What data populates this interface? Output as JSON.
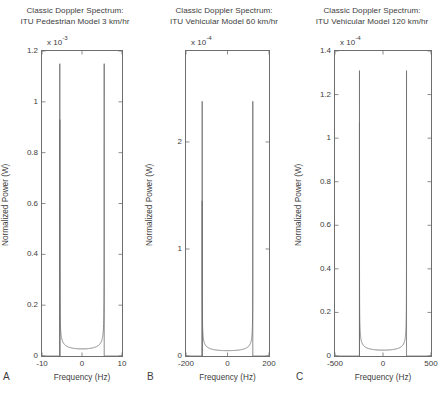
{
  "figure": {
    "background": "#ffffff",
    "line_color": "#6e6e6e",
    "text_color": "#3d3d3d",
    "width": 446,
    "height": 394
  },
  "panels": [
    {
      "letter": "A",
      "title_line1": "Classic Doppler Spectrum:",
      "title_line2": "ITU Pedestrian Model 3 km/hr",
      "exponent_mantissa": "x 10",
      "exponent_power": "-3",
      "ylabel": "Normalized Power (W)",
      "xlabel": "Frequency (Hz)",
      "xticks": [
        -10,
        0,
        10
      ],
      "xtick_labels": [
        "-10",
        "0",
        "10"
      ],
      "yticks": [
        0,
        0.2,
        0.4,
        0.6,
        0.8,
        1,
        1.2
      ],
      "ytick_labels": [
        "0",
        "0.2",
        "0.4",
        "0.6",
        "0.8",
        "1",
        "1.2"
      ],
      "xlim": [
        -10,
        10
      ],
      "ylim": [
        0,
        1.2
      ],
      "chart_data": {
        "type": "line",
        "title": "Classic Doppler Spectrum: ITU Pedestrian Model 3 km/hr",
        "xlabel": "Frequency (Hz)",
        "ylabel": "Normalized Power (W)",
        "xlim": [
          -10,
          10
        ],
        "ylim": [
          0,
          1.2
        ],
        "y_scale_exponent": -3,
        "grid": false,
        "legend": null,
        "doppler_max_hz": 5.55,
        "floor_value": 0.028,
        "left_peak_value": 0.93,
        "right_peak_value": 1.15,
        "description": "U-shaped Jakes classic Doppler spectrum; flat low floor between roughly -4 and +4 Hz rising to sharp spikes at the maximum Doppler frequency."
      }
    },
    {
      "letter": "B",
      "title_line1": "Classic Doppler Spectrum:",
      "title_line2": "ITU Vehicular Model 60 km/hr",
      "exponent_mantissa": "x 10",
      "exponent_power": "-4",
      "ylabel": "Normalized Power (W)",
      "xlabel": "Frequency (Hz)",
      "xticks": [
        -200,
        0,
        200
      ],
      "xtick_labels": [
        "-200",
        "0",
        "200"
      ],
      "yticks": [
        0,
        1,
        2
      ],
      "ytick_labels": [
        "0",
        "1",
        "2"
      ],
      "xlim": [
        -200,
        200
      ],
      "ylim": [
        0,
        2.85
      ],
      "chart_data": {
        "type": "line",
        "title": "Classic Doppler Spectrum: ITU Vehicular Model 60 km/hr",
        "xlabel": "Frequency (Hz)",
        "ylabel": "Normalized Power (W)",
        "xlim": [
          -200,
          200
        ],
        "ylim": [
          0,
          2.85
        ],
        "y_scale_exponent": -4,
        "grid": false,
        "legend": null,
        "doppler_max_hz": 122,
        "floor_value": 0.05,
        "left_peak_value": 1.45,
        "right_peak_value": 2.38,
        "description": "U-shaped Jakes classic Doppler spectrum with a very flat floor and narrow spikes near +/-120 Hz; right spike reaches higher than left."
      }
    },
    {
      "letter": "C",
      "title_line1": "Classic Doppler Spectrum:",
      "title_line2": "ITU Vehicular Model 120 km/hr",
      "exponent_mantissa": "x 10",
      "exponent_power": "-4",
      "ylabel": "Normalized Power (W)",
      "xlabel": "Frequency (Hz)",
      "xticks": [
        -500,
        0,
        500
      ],
      "xtick_labels": [
        "-500",
        "0",
        "500"
      ],
      "yticks": [
        0,
        0.2,
        0.4,
        0.6,
        0.8,
        1,
        1.2,
        1.4
      ],
      "ytick_labels": [
        "0",
        "0.2",
        "0.4",
        "0.6",
        "0.8",
        "1",
        "1.2",
        "1.4"
      ],
      "xlim": [
        -500,
        500
      ],
      "ylim": [
        0,
        1.4
      ],
      "chart_data": {
        "type": "line",
        "title": "Classic Doppler Spectrum: ITU Vehicular Model 120 km/hr",
        "xlabel": "Frequency (Hz)",
        "ylabel": "Normalized Power (W)",
        "xlim": [
          -500,
          500
        ],
        "ylim": [
          0,
          1.4
        ],
        "y_scale_exponent": -4,
        "grid": false,
        "legend": null,
        "doppler_max_hz": 245,
        "floor_value": 0.027,
        "left_peak_value": 1.07,
        "right_peak_value": 1.31,
        "description": "U-shaped Jakes classic Doppler spectrum with flat floor and sharp spikes near +/-245 Hz; right spike taller than left."
      }
    }
  ]
}
